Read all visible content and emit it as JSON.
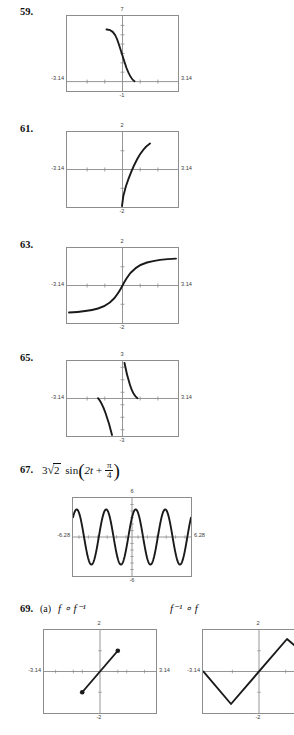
{
  "page": {
    "width": 294,
    "height": 735,
    "background": "#ffffff",
    "ink": "#111111",
    "frame_color": "#8d8d8d",
    "axis_color": "#7a7a7a",
    "curve_color": "#1a1a1a"
  },
  "problems": [
    {
      "id": "59",
      "number_label": "59.",
      "expression": "",
      "screens": [
        {
          "name": "screen-59",
          "xmin_label": "-3.14",
          "xmax_label": "3.14",
          "ymax_label": "7",
          "ymin_label": "-1",
          "xmin": -3.14,
          "xmax": 3.14,
          "ymin": -1,
          "ymax": 7,
          "curve_type": "arccot-like-decreasing",
          "description": "steeply decreasing curve from upper-left near x=-0.9 down to the x-axis near x=0.55"
        }
      ]
    },
    {
      "id": "61",
      "number_label": "61.",
      "expression": "",
      "screens": [
        {
          "name": "screen-61",
          "xmin_label": "-3.14",
          "xmax_label": "3.14",
          "ymax_label": "2",
          "ymin_label": "-2",
          "xmin": -3.14,
          "xmax": 3.14,
          "ymin": -2,
          "ymax": 2,
          "curve_type": "increasing-s-steep",
          "description": "increasing curve from (-0.05,-2) rising through origin area up to about (1.5,1.75)"
        }
      ]
    },
    {
      "id": "63",
      "number_label": "63.",
      "expression": "",
      "screens": [
        {
          "name": "screen-63",
          "xmin_label": "-3.14",
          "xmax_label": "3.14",
          "ymax_label": "2",
          "ymin_label": "-2",
          "xmin": -3.14,
          "xmax": 3.14,
          "ymin": -2,
          "ymax": 2,
          "curve_type": "arctangent-sigmoid",
          "description": "odd sigmoid through origin, asymptotic to about y=+1.4 and y=-1.4"
        }
      ]
    },
    {
      "id": "65",
      "number_label": "65.",
      "expression": "",
      "screens": [
        {
          "name": "screen-65",
          "xmin_label": "-3.14",
          "xmax_label": "3.14",
          "ymax_label": "3",
          "ymin_label": "-3",
          "xmin": -3.14,
          "xmax": 3.14,
          "ymin": -3,
          "ymax": 3,
          "curve_type": "two-branch-decreasing",
          "description": "two decreasing branches: left branch from (-1.4,0) down to (-0.15,-3); right branch from (0.1,3) down to (0.75,0)"
        }
      ]
    },
    {
      "id": "67",
      "number_label": "67.",
      "expression": "3√2 sin(2t + π/4)",
      "expr_parts": {
        "coefficient": "3",
        "radical": "2",
        "function": "sin",
        "inner_left": "2t",
        "operator": "+",
        "fraction_num": "π",
        "fraction_den": "4"
      },
      "screens": [
        {
          "name": "screen-67",
          "xmin_label": "-6.28",
          "xmax_label": "6.28",
          "ymax_label": "6",
          "ymin_label": "-6",
          "xmin": -6.28,
          "xmax": 6.28,
          "ymin": -6,
          "ymax": 6,
          "curve_type": "sinusoid",
          "amplitude": 4.243,
          "angular_frequency": 2,
          "phase": 0.7854,
          "description": "sinusoid 3√2 sin(2t + π/4), amplitude about 4.24, four full cycles across the window"
        }
      ]
    },
    {
      "id": "69",
      "number_label": "69.",
      "part_label": "(a)",
      "expr_left": "f ∘ f⁻¹",
      "expr_right": "f⁻¹ ∘ f",
      "screens": [
        {
          "name": "screen-69a",
          "xmin_label": "-3.14",
          "xmax_label": "3.14",
          "ymax_label": "2",
          "ymin_label": "-2",
          "xmin": -3.14,
          "xmax": 3.14,
          "ymin": -2,
          "ymax": 2,
          "curve_type": "segment-with-endpoints",
          "description": "line segment y=x from (-1,-1) to (1,1) with solid dot endpoints"
        },
        {
          "name": "screen-69b",
          "xmin_label": "-3.14",
          "xmax_label": "",
          "ymax_label": "2",
          "ymin_label": "-2",
          "xmin": -3.14,
          "xmax": 3.14,
          "ymin": -2,
          "ymax": 2,
          "curve_type": "v-then-inverted-v",
          "description": "piecewise zigzag: down from (-3.14,0) to (-1.57,-1.57), up through origin to (1.57,1.57), then turning down"
        }
      ]
    }
  ]
}
